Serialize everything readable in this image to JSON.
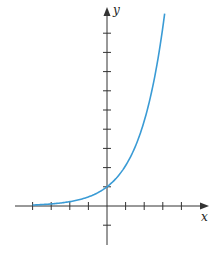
{
  "chart_data": {
    "type": "line",
    "title": "",
    "xlabel": "x",
    "ylabel": "y",
    "function": "exponential growth (y = b^x, b ≈ 2.1)",
    "x_ticks": [
      -4,
      -3,
      -2,
      -1,
      1,
      2,
      3,
      4
    ],
    "y_ticks": [
      -1,
      1,
      2,
      3,
      4,
      5,
      6,
      7,
      8,
      9
    ],
    "xlim": [
      -5,
      5.5
    ],
    "ylim": [
      -2,
      10.3
    ],
    "grid": false,
    "legend": null,
    "series": [
      {
        "name": "curve",
        "color": "#3a9bd5",
        "x": [
          -4,
          -3,
          -2,
          -1,
          0,
          0.5,
          1,
          1.5,
          2,
          2.5,
          3,
          3.1
        ],
        "values": [
          0.05,
          0.1,
          0.22,
          0.47,
          1,
          1.45,
          2.1,
          3.05,
          4.4,
          6.4,
          9.3,
          10.0
        ]
      }
    ],
    "y_intercept": 1
  },
  "labels": {
    "x_axis": "x",
    "y_axis": "y"
  },
  "colors": {
    "curve": "#3a9bd5",
    "axes": "#333333"
  }
}
